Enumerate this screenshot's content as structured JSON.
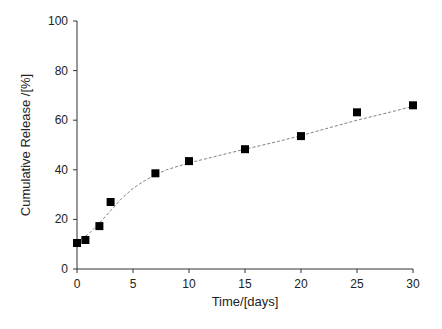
{
  "chart_data": {
    "type": "scatter",
    "title": "",
    "xlabel": "Time/[days]",
    "ylabel": "Cumulative Release /[%]",
    "xlim": [
      0,
      30
    ],
    "ylim": [
      0,
      100
    ],
    "xticks": [
      0,
      5,
      10,
      15,
      20,
      25,
      30
    ],
    "yticks": [
      0,
      20,
      40,
      60,
      80,
      100
    ],
    "grid": false,
    "legend": null,
    "series": [
      {
        "name": "Cumulative Release",
        "marker": "square",
        "color": "#000000",
        "x": [
          0,
          0.75,
          2,
          3,
          7,
          10,
          15,
          20,
          25,
          30
        ],
        "y": [
          10.5,
          11.7,
          17.3,
          27.0,
          38.6,
          43.5,
          48.3,
          53.6,
          63.2,
          66.0
        ]
      }
    ],
    "fit_line": {
      "style": "dashed",
      "color": "#808080",
      "x": [
        0,
        1,
        2,
        3,
        4,
        5,
        6,
        7,
        8,
        10,
        12,
        15,
        18,
        20,
        22,
        25,
        28,
        30
      ],
      "y": [
        11.0,
        14.0,
        18.5,
        23.5,
        28.5,
        32.5,
        35.5,
        38.0,
        40.0,
        42.8,
        45.0,
        48.3,
        51.5,
        53.8,
        56.3,
        60.0,
        63.3,
        65.6
      ]
    }
  }
}
